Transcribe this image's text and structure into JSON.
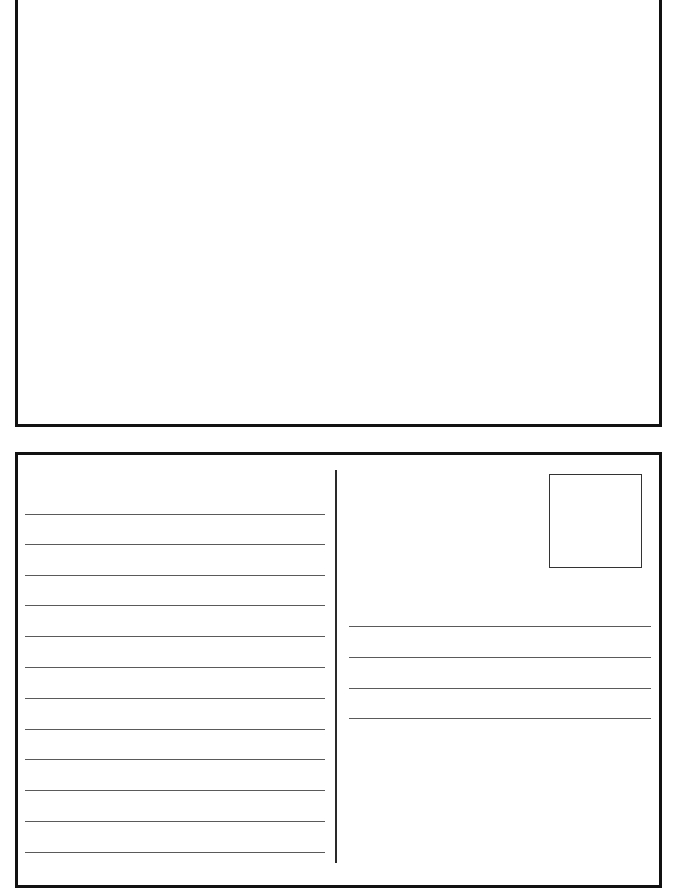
{
  "page": {
    "width": 678,
    "height": 890,
    "background": "#ffffff"
  },
  "postcard_front": {
    "label": "",
    "frame": {
      "left": 15,
      "top": -3,
      "width": 647,
      "height": 430
    },
    "border_color": "#111111"
  },
  "postcard_back": {
    "frame": {
      "left": 15,
      "top": 452,
      "width": 647,
      "height": 436
    },
    "border_color": "#111111",
    "message_area": {
      "line_count": 12,
      "line_left": 25,
      "line_width": 300,
      "line_y": [
        514,
        544,
        575,
        605,
        636,
        667,
        698,
        729,
        759,
        790,
        821,
        852
      ]
    },
    "divider": {
      "left": 335,
      "top": 470,
      "height": 393
    },
    "stamp_box": {
      "left": 549,
      "top": 474,
      "width": 93,
      "height": 94
    },
    "address_area": {
      "line_count": 4,
      "line_left": 349,
      "line_width": 302,
      "line_y": [
        626,
        657,
        688,
        718
      ]
    }
  },
  "colors": {
    "border": "#111111",
    "ruled_line": "#5a5a5a",
    "divider": "#2a2a2a",
    "stamp_border": "#333333"
  }
}
